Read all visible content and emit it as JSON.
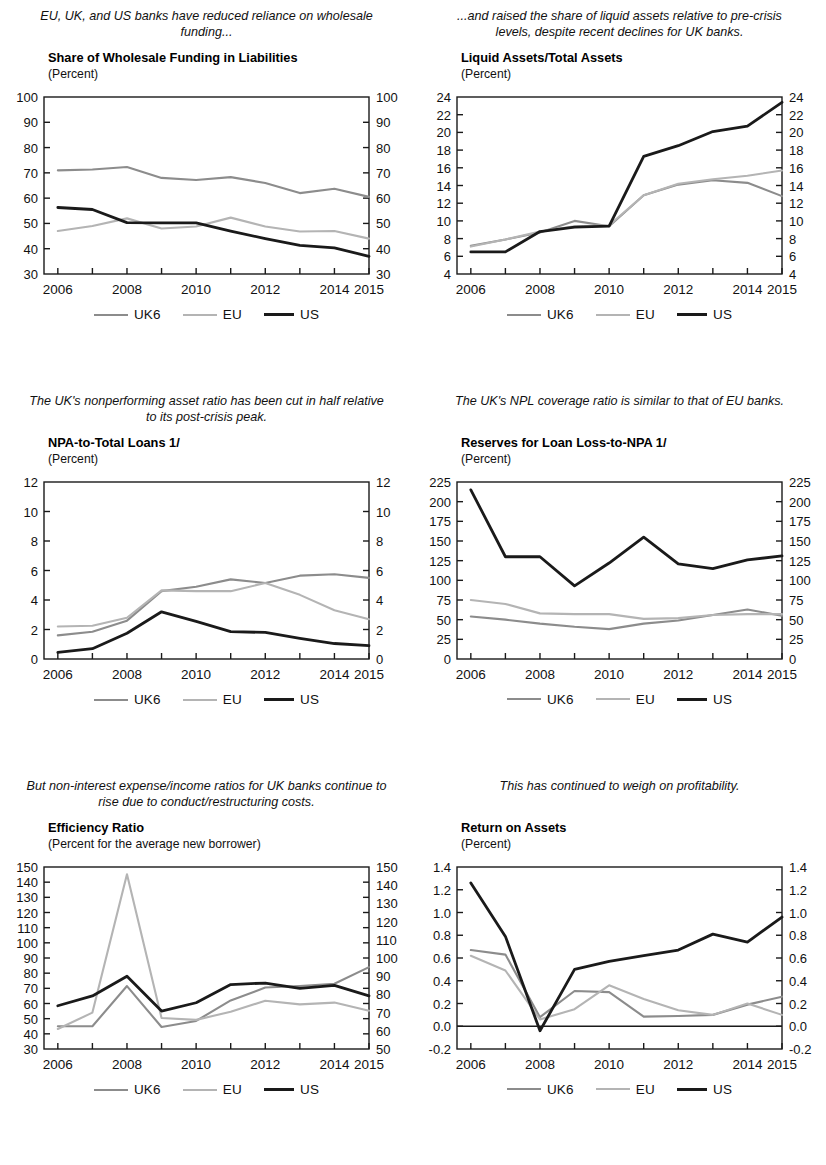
{
  "series_meta": {
    "uk6": {
      "name": "UK6",
      "color": "#8c8c8c",
      "width": 2.1
    },
    "eu": {
      "name": "EU",
      "color": "#b4b4b4",
      "width": 2.1
    },
    "us": {
      "name": "US",
      "color": "#1a1a1a",
      "width": 2.8
    }
  },
  "legend": {
    "uk6_label": "UK6",
    "eu_label": "EU",
    "us_label": "US"
  },
  "footnote": {
    "text": ""
  },
  "panels": [
    {
      "id": "wholesale-funding",
      "caption": "EU, UK, and US banks have reduced reliance on wholesale funding...",
      "title": "Share of Wholesale Funding in Liabilities",
      "units": "(Percent)"
    },
    {
      "id": "liquid-assets",
      "caption": "...and raised the share of liquid assets relative to pre-crisis levels, despite recent declines for UK banks.",
      "title": "Liquid Assets/Total Assets",
      "units": "(Percent)"
    },
    {
      "id": "npa-to-loans",
      "caption": "The UK's nonperforming asset ratio has been cut in half relative to its post-crisis peak.",
      "title": "NPA-to-Total Loans 1/",
      "units": "(Percent)"
    },
    {
      "id": "reserves-loan-loss",
      "caption": "The UK's NPL coverage ratio is similar to that of EU banks.",
      "title": "Reserves for Loan Loss-to-NPA 1/",
      "units": "(Percent)"
    },
    {
      "id": "efficiency-ratio",
      "caption": "But non-interest expense/income ratios for UK banks continue to rise due to conduct/restructuring costs.",
      "title": "Efficiency Ratio",
      "units": "(Percent for the average new borrower)"
    },
    {
      "id": "return-on-assets",
      "caption": "This has continued to weigh on profitability.",
      "title": "Return on Assets",
      "units": "(Percent)"
    }
  ],
  "chart_data": [
    {
      "type": "line",
      "id": "wholesale-funding",
      "title": "Share of Wholesale Funding in Liabilities",
      "subtitle": "(Percent)",
      "xlabel": "",
      "ylabel": "Percent",
      "x": [
        2006,
        2007,
        2008,
        2009,
        2010,
        2011,
        2012,
        2013,
        2014,
        2015
      ],
      "xtick_labels": [
        "2006",
        "2008",
        "2010",
        "2012",
        "2014",
        "2015"
      ],
      "xtick_values": [
        2006,
        2008,
        2010,
        2012,
        2014,
        2015
      ],
      "xlim": [
        2005.6,
        2015.0
      ],
      "ylim": [
        30,
        100
      ],
      "ytick_values": [
        30,
        40,
        50,
        60,
        70,
        80,
        90,
        100
      ],
      "ytick_labels": [
        "30",
        "40",
        "50",
        "60",
        "70",
        "80",
        "90",
        "100"
      ],
      "y2lim": [
        30,
        100
      ],
      "y2tick_labels": [
        "30",
        "40",
        "50",
        "60",
        "70",
        "80",
        "90",
        "100"
      ],
      "grid": false,
      "legend_position": "bottom",
      "series": [
        {
          "name": "UK6",
          "values": [
            71.0,
            71.3,
            72.3,
            68.0,
            67.2,
            68.3,
            66.0,
            62.0,
            63.7,
            60.5
          ]
        },
        {
          "name": "EU",
          "values": [
            47.0,
            49.0,
            52.0,
            48.0,
            48.8,
            52.3,
            48.8,
            46.8,
            47.0,
            44.0
          ]
        },
        {
          "name": "US",
          "values": [
            56.3,
            55.5,
            50.3,
            50.2,
            50.2,
            47.0,
            44.0,
            41.3,
            40.3,
            37.0
          ]
        }
      ]
    },
    {
      "type": "line",
      "id": "liquid-assets",
      "title": "Liquid Assets/Total Assets",
      "subtitle": "(Percent)",
      "xlabel": "",
      "ylabel": "Percent",
      "x": [
        2006,
        2007,
        2008,
        2009,
        2010,
        2011,
        2012,
        2013,
        2014,
        2015
      ],
      "xtick_labels": [
        "2006",
        "2008",
        "2010",
        "2012",
        "2014",
        "2015"
      ],
      "xtick_values": [
        2006,
        2008,
        2010,
        2012,
        2014,
        2015
      ],
      "xlim": [
        2005.6,
        2015.0
      ],
      "ylim": [
        4,
        24
      ],
      "ytick_values": [
        4,
        6,
        8,
        10,
        12,
        14,
        16,
        18,
        20,
        22,
        24
      ],
      "ytick_labels": [
        "4",
        "6",
        "8",
        "10",
        "12",
        "14",
        "16",
        "18",
        "20",
        "22",
        "24"
      ],
      "y2lim": [
        4,
        24
      ],
      "y2tick_labels": [
        "4",
        "6",
        "8",
        "10",
        "12",
        "14",
        "16",
        "18",
        "20",
        "22",
        "24"
      ],
      "grid": false,
      "legend_position": "bottom",
      "series": [
        {
          "name": "UK6",
          "values": [
            7.2,
            7.9,
            8.7,
            10.0,
            9.4,
            12.9,
            14.1,
            14.6,
            14.3,
            12.8
          ]
        },
        {
          "name": "EU",
          "values": [
            7.1,
            7.9,
            8.8,
            9.4,
            9.5,
            12.9,
            14.2,
            14.7,
            15.1,
            15.7
          ]
        },
        {
          "name": "US",
          "values": [
            6.5,
            6.5,
            8.8,
            9.3,
            9.4,
            17.3,
            18.5,
            20.1,
            20.7,
            23.4
          ]
        }
      ]
    },
    {
      "type": "line",
      "id": "npa-to-loans",
      "title": "NPA-to-Total Loans 1/",
      "subtitle": "(Percent)",
      "xlabel": "",
      "ylabel": "Percent",
      "x": [
        2006,
        2007,
        2008,
        2009,
        2010,
        2011,
        2012,
        2013,
        2014,
        2015
      ],
      "xtick_labels": [
        "2006",
        "2008",
        "2010",
        "2012",
        "2014",
        "2015"
      ],
      "xtick_values": [
        2006,
        2008,
        2010,
        2012,
        2014,
        2015
      ],
      "xlim": [
        2005.6,
        2015.0
      ],
      "ylim": [
        0,
        12
      ],
      "ytick_values": [
        0,
        2,
        4,
        6,
        8,
        10,
        12
      ],
      "ytick_labels": [
        "0",
        "2",
        "4",
        "6",
        "8",
        "10",
        "12"
      ],
      "y2lim": [
        0,
        12
      ],
      "y2tick_labels": [
        "0",
        "2",
        "4",
        "6",
        "8",
        "10",
        "12"
      ],
      "grid": false,
      "legend_position": "bottom",
      "series": [
        {
          "name": "UK6",
          "values": [
            1.6,
            1.85,
            2.6,
            4.6,
            4.9,
            5.4,
            5.15,
            5.65,
            5.75,
            5.5
          ]
        },
        {
          "name": "EU",
          "values": [
            2.2,
            2.25,
            2.8,
            4.65,
            4.6,
            4.6,
            5.15,
            4.35,
            3.3,
            2.7
          ]
        },
        {
          "name": "US",
          "values": [
            0.45,
            0.7,
            1.75,
            3.2,
            2.55,
            1.85,
            1.8,
            1.4,
            1.05,
            0.9
          ]
        }
      ]
    },
    {
      "type": "line",
      "id": "reserves-loan-loss",
      "title": "Reserves for Loan Loss-to-NPA 1/",
      "subtitle": "(Percent)",
      "xlabel": "",
      "ylabel": "Percent",
      "x": [
        2006,
        2007,
        2008,
        2009,
        2010,
        2011,
        2012,
        2013,
        2014,
        2015
      ],
      "xtick_labels": [
        "2006",
        "2008",
        "2010",
        "2012",
        "2014",
        "2015"
      ],
      "xtick_values": [
        2006,
        2008,
        2010,
        2012,
        2014,
        2015
      ],
      "xlim": [
        2005.6,
        2015.0
      ],
      "ylim": [
        0,
        225
      ],
      "ytick_values": [
        0,
        25,
        50,
        75,
        100,
        125,
        150,
        175,
        200,
        225
      ],
      "ytick_labels": [
        "0",
        "25",
        "50",
        "75",
        "100",
        "125",
        "150",
        "175",
        "200",
        "225"
      ],
      "y2lim": [
        0,
        225
      ],
      "y2tick_labels": [
        "0",
        "25",
        "50",
        "75",
        "100",
        "125",
        "150",
        "175",
        "200",
        "225"
      ],
      "grid": false,
      "legend_position": "bottom",
      "series": [
        {
          "name": "UK6",
          "values": [
            54,
            50,
            45,
            41,
            38,
            45,
            49,
            56,
            63,
            55
          ]
        },
        {
          "name": "EU",
          "values": [
            75,
            70,
            58,
            57,
            57,
            51,
            52,
            56,
            57,
            57
          ]
        },
        {
          "name": "US",
          "values": [
            215,
            130,
            130,
            93,
            122,
            155,
            121,
            115,
            126,
            131
          ]
        }
      ]
    },
    {
      "type": "line",
      "id": "efficiency-ratio",
      "title": "Efficiency Ratio",
      "subtitle": "(Percent for the average new borrower)",
      "xlabel": "",
      "ylabel": "Percent",
      "x": [
        2006,
        2007,
        2008,
        2009,
        2010,
        2011,
        2012,
        2013,
        2014,
        2015
      ],
      "xtick_labels": [
        "2006",
        "2008",
        "2010",
        "2012",
        "2014",
        "2015"
      ],
      "xtick_values": [
        2006,
        2008,
        2010,
        2012,
        2014,
        2015
      ],
      "xlim": [
        2005.6,
        2015.0
      ],
      "ylim": [
        30,
        150
      ],
      "ytick_values": [
        30,
        40,
        50,
        60,
        70,
        80,
        90,
        100,
        110,
        120,
        130,
        140,
        150
      ],
      "ytick_labels": [
        "30",
        "40",
        "50",
        "60",
        "70",
        "80",
        "90",
        "100",
        "110",
        "120",
        "130",
        "140",
        "150"
      ],
      "y2lim": [
        50,
        150
      ],
      "y2tick_labels": [
        "50",
        "60",
        "70",
        "80",
        "90",
        "100",
        "110",
        "120",
        "130",
        "140",
        "150"
      ],
      "grid": false,
      "legend_position": "bottom",
      "note": "Left axis 30-150 applies to UK6 and US; right axis 50-150 applies to EU.",
      "series": [
        {
          "name": "UK6",
          "values": [
            45,
            45,
            71.5,
            44.5,
            48.5,
            62,
            70.5,
            71.5,
            73,
            84
          ]
        },
        {
          "name": "EU",
          "values": [
            61,
            70,
            146,
            67,
            66,
            70.5,
            76.5,
            74.5,
            75.5,
            71
          ]
        },
        {
          "name": "US",
          "values": [
            58.5,
            65,
            78,
            55,
            60.5,
            72.5,
            73.5,
            70,
            72,
            65
          ]
        }
      ]
    },
    {
      "type": "line",
      "id": "return-on-assets",
      "title": "Return on Assets",
      "subtitle": "(Percent)",
      "xlabel": "",
      "ylabel": "Percent",
      "x": [
        2006,
        2007,
        2008,
        2009,
        2010,
        2011,
        2012,
        2013,
        2014,
        2015
      ],
      "xtick_labels": [
        "2006",
        "2008",
        "2010",
        "2012",
        "2014",
        "2015"
      ],
      "xtick_values": [
        2006,
        2008,
        2010,
        2012,
        2014,
        2015
      ],
      "xlim": [
        2005.6,
        2015.0
      ],
      "ylim": [
        -0.2,
        1.4
      ],
      "ytick_values": [
        -0.2,
        0.0,
        0.2,
        0.4,
        0.6,
        0.8,
        1.0,
        1.2,
        1.4
      ],
      "ytick_labels": [
        "-0.2",
        "0.0",
        "0.2",
        "0.4",
        "0.6",
        "0.8",
        "1.0",
        "1.2",
        "1.4"
      ],
      "y2lim": [
        -0.2,
        1.4
      ],
      "y2tick_labels": [
        "-0.2",
        "0.0",
        "0.2",
        "0.4",
        "0.6",
        "0.8",
        "1.0",
        "1.2",
        "1.4"
      ],
      "grid": false,
      "zero_line": 0.0,
      "legend_position": "bottom",
      "series": [
        {
          "name": "UK6",
          "values": [
            0.67,
            0.63,
            0.08,
            0.31,
            0.3,
            0.085,
            0.09,
            0.1,
            0.19,
            0.26
          ]
        },
        {
          "name": "EU",
          "values": [
            0.62,
            0.49,
            0.06,
            0.15,
            0.36,
            0.24,
            0.14,
            0.1,
            0.2,
            0.1
          ]
        },
        {
          "name": "US",
          "values": [
            1.26,
            0.79,
            -0.04,
            0.5,
            0.57,
            0.62,
            0.67,
            0.81,
            0.74,
            0.96
          ]
        }
      ]
    }
  ]
}
